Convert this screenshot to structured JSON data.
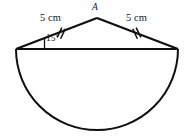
{
  "figure": {
    "kind": "geometry-diagram",
    "background_color": "#ffffff",
    "stroke_color": "#100f0f",
    "labels": {
      "apex": "A",
      "left_side_length": "5 cm",
      "right_side_length": "5 cm",
      "base_angle": "15°"
    },
    "geometry": {
      "left_vertex": {
        "x": 16,
        "y": 49
      },
      "right_vertex": {
        "x": 178,
        "y": 49
      },
      "apex_point": {
        "x": 97,
        "y": 18
      },
      "semicircle_center": {
        "x": 97,
        "y": 49
      },
      "semicircle_radius": 81,
      "semicircle_bottom_y": 130,
      "congruence_ticks_per_side": 2
    }
  }
}
